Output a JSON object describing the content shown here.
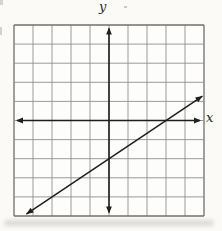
{
  "figure": {
    "colors": {
      "page_background": "#fbfaf7",
      "plot_background": "#fdfdfb",
      "grid_line": "#909090",
      "grid_border": "#6f6f6f",
      "axis": "#1f1f1f",
      "data_line": "#1f1f1f",
      "label_text": "#2a2a2a",
      "scan_shadow": "#c0c0be"
    }
  },
  "chart_data": {
    "type": "line",
    "title": "",
    "xlabel": "x",
    "ylabel": "y",
    "xlim": [
      -5,
      5
    ],
    "ylim": [
      -5,
      5
    ],
    "grid": "on",
    "grid_spacing": 1,
    "axis_tick_labels": "none",
    "axes_style": "center-origin-arrowheads-both-ends",
    "series": [
      {
        "name": "line-1",
        "equation": "y = (2/3)x - 2",
        "slope": 0.6667,
        "y_intercept": -2,
        "x_intercept": 3,
        "arrow_ends": "both",
        "draw_range_x": [
          -4.35,
          4.92
        ],
        "lattice_points": [
          [
            -3,
            -4
          ],
          [
            0,
            -2
          ],
          [
            3,
            0
          ]
        ]
      }
    ]
  }
}
